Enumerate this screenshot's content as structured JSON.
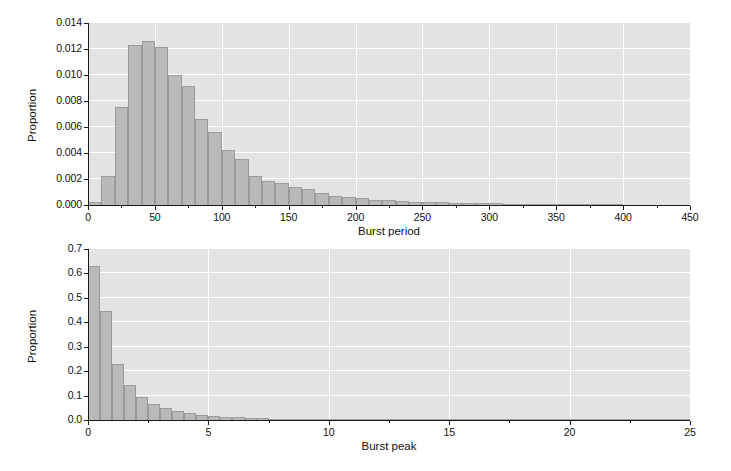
{
  "chart_data": [
    {
      "type": "bar",
      "title": "",
      "xlabel": "Burst period",
      "ylabel": "Proportion",
      "xlim": [
        0,
        450
      ],
      "ylim": [
        0.0,
        0.014
      ],
      "xticks": [
        "0",
        "50",
        "100",
        "150",
        "200",
        "250",
        "300",
        "350",
        "400",
        "450"
      ],
      "xtick_values": [
        0,
        50,
        100,
        150,
        200,
        250,
        300,
        350,
        400,
        450
      ],
      "yticks": [
        "0.000",
        "0.002",
        "0.004",
        "0.006",
        "0.008",
        "0.010",
        "0.012",
        "0.014"
      ],
      "ytick_values": [
        0.0,
        0.002,
        0.004,
        0.006,
        0.008,
        0.01,
        0.012,
        0.014
      ],
      "grid": true,
      "bin_width": 10,
      "bin_starts": [
        0,
        10,
        20,
        30,
        40,
        50,
        60,
        70,
        80,
        90,
        100,
        110,
        120,
        130,
        140,
        150,
        160,
        170,
        180,
        190,
        200,
        210,
        220,
        230,
        240,
        250,
        260,
        270,
        280,
        290,
        300,
        310,
        320,
        330,
        340,
        350,
        360,
        370,
        380,
        390
      ],
      "values": [
        0.0002,
        0.00222,
        0.00752,
        0.01228,
        0.01262,
        0.01212,
        0.01002,
        0.00912,
        0.00662,
        0.00562,
        0.00422,
        0.00352,
        0.00222,
        0.00182,
        0.00172,
        0.00142,
        0.00122,
        0.00092,
        0.00072,
        0.00062,
        0.00052,
        0.00042,
        0.00036,
        0.00032,
        0.00026,
        0.00022,
        0.0002,
        0.00018,
        0.00016,
        0.00014,
        0.00012,
        0.0001,
        9e-05,
        8e-05,
        7e-05,
        6e-05,
        5e-05,
        4e-05,
        3e-05,
        2e-05
      ]
    },
    {
      "type": "bar",
      "title": "",
      "xlabel": "Burst peak",
      "ylabel": "Proportion",
      "xlim": [
        0,
        25
      ],
      "ylim": [
        0.0,
        0.7
      ],
      "xticks": [
        "0",
        "5",
        "10",
        "15",
        "20",
        "25"
      ],
      "xtick_values": [
        0,
        5,
        10,
        15,
        20,
        25
      ],
      "yticks": [
        "0.0",
        "0.1",
        "0.2",
        "0.3",
        "0.4",
        "0.5",
        "0.6",
        "0.7"
      ],
      "ytick_values": [
        0.0,
        0.1,
        0.2,
        0.3,
        0.4,
        0.5,
        0.6,
        0.7
      ],
      "grid": true,
      "bin_width": 0.5,
      "bin_starts": [
        0,
        0.5,
        1.0,
        1.5,
        2.0,
        2.5,
        3.0,
        3.5,
        4.0,
        4.5,
        5.0,
        5.5,
        6.0,
        6.5,
        7.0,
        7.5,
        8.0,
        8.5,
        9.0,
        9.5,
        10.0,
        10.5,
        11.0,
        11.5,
        12.0,
        12.5,
        13.0,
        13.5,
        14.0,
        14.5,
        15.0,
        15.5,
        16.0,
        16.5,
        17.0,
        17.5,
        18.0,
        18.5,
        19.0,
        19.5,
        20.0,
        20.5,
        21.0,
        21.5,
        22.0,
        22.5,
        23.0,
        23.5,
        24.0,
        24.5
      ],
      "values": [
        0.63,
        0.445,
        0.228,
        0.143,
        0.094,
        0.066,
        0.049,
        0.035,
        0.028,
        0.021,
        0.016,
        0.013,
        0.0105,
        0.0085,
        0.0068,
        0.0056,
        0.0046,
        0.0038,
        0.0031,
        0.0026,
        0.0022,
        0.0019,
        0.0016,
        0.0014,
        0.0012,
        0.001,
        0.0009,
        0.0008,
        0.0007,
        0.0006,
        0.0005,
        0.00045,
        0.0004,
        0.00036,
        0.00032,
        0.00028,
        0.00025,
        0.00022,
        0.0002,
        0.00018,
        0.00016,
        0.00014,
        0.00012,
        0.00011,
        0.0001,
        9e-05,
        8e-05,
        7e-05,
        6e-05,
        5e-05
      ]
    }
  ],
  "style": {
    "plot_background": "#e3e3e3",
    "grid_color": "#ffffff",
    "bar_fill": "#b9b9b9",
    "bar_edge": "#9a9a9a",
    "axis_color": "#1a1a1a",
    "text_color": "#111111",
    "figure_background": "#ffffff"
  }
}
